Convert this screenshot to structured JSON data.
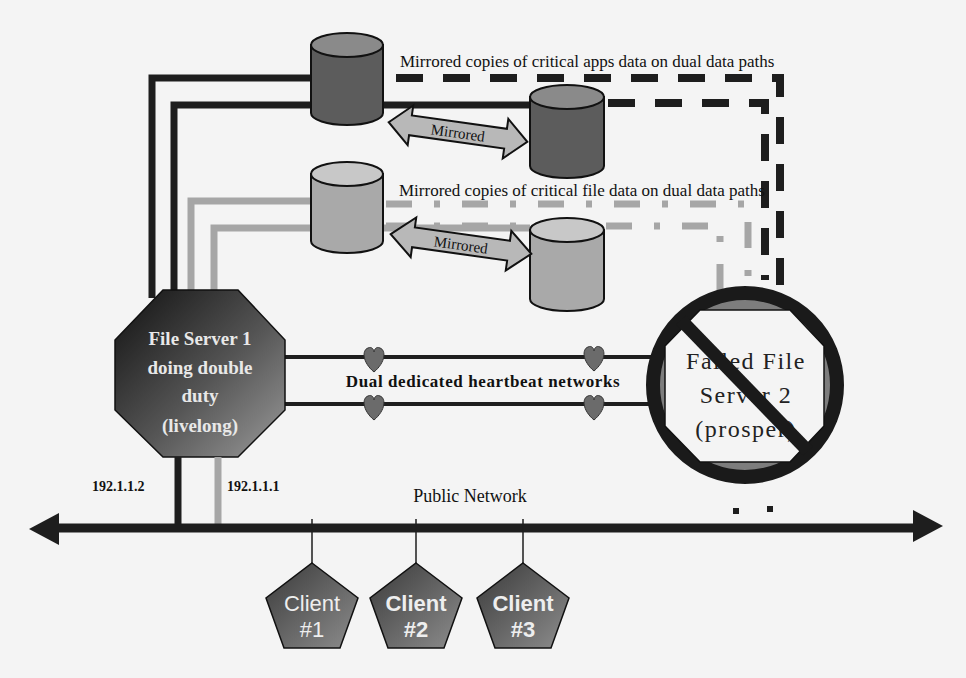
{
  "diagram": {
    "labels": {
      "apps_mirror_caption": "Mirrored copies of critical apps data on dual data paths",
      "file_mirror_caption": "Mirrored copies of critical file data on dual data paths",
      "mirrored_arrow_top": "Mirrored",
      "mirrored_arrow_bottom": "Mirrored",
      "heartbeat_caption": "Dual dedicated heartbeat networks",
      "public_network": "Public Network",
      "ip_left": "192.1.1.2",
      "ip_right": "192.1.1.1"
    },
    "file_server_1": {
      "line1": "File Server 1",
      "line2": "doing double",
      "line3": "duty",
      "line4": "(livelong)"
    },
    "file_server_2": {
      "line1": "Failed File",
      "line2": "Server 2",
      "line3": "(prosper)",
      "status": "failed"
    },
    "clients": [
      {
        "line1": "Client",
        "line2": "#1"
      },
      {
        "line1": "Client",
        "line2": "#2"
      },
      {
        "line1": "Client",
        "line2": "#3"
      }
    ],
    "storage": [
      {
        "name": "apps-disk-primary",
        "tone": "dark"
      },
      {
        "name": "apps-disk-mirror",
        "tone": "dark"
      },
      {
        "name": "file-disk-primary",
        "tone": "light"
      },
      {
        "name": "file-disk-mirror",
        "tone": "light"
      }
    ],
    "colors": {
      "background": "#f4f4f4",
      "dark_line": "#1e1e1e",
      "light_line": "#a6a6a6",
      "dark_disk": "#5c5c5c",
      "light_disk": "#a9a9a9",
      "arrow_fill": "#b8b8b8",
      "heart": "#6b6b6b",
      "server_dark": "#202020",
      "server_mid": "#7a7a7a",
      "failed_ring": "#1a1a1a",
      "failed_band": "#808080"
    }
  }
}
